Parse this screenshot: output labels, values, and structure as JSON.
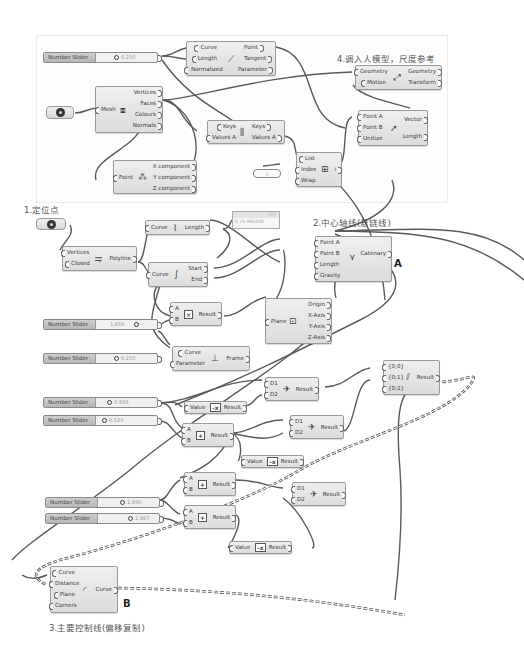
{
  "canvas": {
    "background": "#ffffff",
    "wire_color": "#5a5a5a",
    "node_fill": "#e6e6e6"
  },
  "annotations": {
    "step1": "1.定位点",
    "step2": "2.中心轴线(悬链线)",
    "step3": "3.主要控制线(偏移复制)",
    "step4": "4.调入人模型，尺度参考",
    "label_a": "A",
    "label_b": "B"
  },
  "sliders": [
    {
      "id": "s1",
      "label": "Number Slider",
      "value": "0.250"
    },
    {
      "id": "s2",
      "label": "Number Slider",
      "value": "1.666"
    },
    {
      "id": "s3",
      "label": "Number Slider",
      "value": "0.250"
    },
    {
      "id": "s4",
      "label": "Number Slider",
      "value": "0.939"
    },
    {
      "id": "s5",
      "label": "Number Slider",
      "value": "0.520"
    },
    {
      "id": "s6",
      "label": "Number Slider",
      "value": "1.890"
    },
    {
      "id": "s7",
      "label": "Number Slider",
      "value": "2.987"
    }
  ],
  "nodes": {
    "eval_length": {
      "inputs": [
        "Curve",
        "Length",
        "Normalized"
      ],
      "outputs": [
        "Point",
        "Tangent",
        "Parameter"
      ],
      "icon": "eval-length-icon"
    },
    "mesh_decon": {
      "inputs": [
        "Mesh"
      ],
      "outputs": [
        "Vertices",
        "Faces",
        "Colours",
        "Normals"
      ],
      "icon": "mesh-icon"
    },
    "decon_point": {
      "inputs": [
        "Point"
      ],
      "outputs": [
        "X component",
        "Y component",
        "Z component"
      ],
      "icon": "deconstruct-point-icon"
    },
    "sort_list": {
      "inputs": [
        "Keys",
        "Values A"
      ],
      "outputs": [
        "Keys",
        "Values A"
      ],
      "icon": "sort-icon"
    },
    "list_item": {
      "inputs": [
        "List",
        "Index",
        "Wrap"
      ],
      "outputs": [
        "i"
      ],
      "icon": "list-item-icon"
    },
    "vector_2pt": {
      "inputs": [
        "Point A",
        "Point B",
        "Unitize"
      ],
      "outputs": [
        "Vector",
        "Length"
      ],
      "icon": "vector-icon"
    },
    "move": {
      "inputs": [
        "Geometry",
        "Motion"
      ],
      "outputs": [
        "Geometry",
        "Transform"
      ],
      "icon": "move-icon"
    },
    "polyline": {
      "inputs": [
        "Vertices",
        "Closed"
      ],
      "outputs": [
        "Polyline"
      ],
      "icon": "polyline-icon"
    },
    "length": {
      "inputs": [
        "Curve"
      ],
      "outputs": [
        "Length"
      ],
      "icon": "length-icon"
    },
    "end_points": {
      "inputs": [
        "Curve"
      ],
      "outputs": [
        "Start",
        "End"
      ],
      "icon": "endpoints-icon"
    },
    "catenary": {
      "inputs": [
        "Point A",
        "Point B",
        "Length",
        "Gravity"
      ],
      "outputs": [
        "Catenary"
      ],
      "icon": "catenary-icon"
    },
    "multiply": {
      "inputs": [
        "A",
        "B"
      ],
      "outputs": [
        "Result"
      ],
      "icon_text": "×"
    },
    "deplane": {
      "inputs": [
        "Plane"
      ],
      "outputs": [
        "Origin",
        "X-Axis",
        "Y-Axis",
        "Z-Axis"
      ],
      "icon": "plane-icon"
    },
    "perp_frame": {
      "inputs": [
        "Curve",
        "Parameter"
      ],
      "outputs": [
        "Frame"
      ],
      "icon": "frame-icon"
    },
    "merge1": {
      "inputs": [
        "D1",
        "D2"
      ],
      "outputs": [
        "Result"
      ],
      "icon": "merge-icon"
    },
    "negative1": {
      "inputs": [
        "Value"
      ],
      "outputs": [
        "Result"
      ],
      "icon_text": "-x"
    },
    "add1": {
      "inputs": [
        "A",
        "B"
      ],
      "outputs": [
        "Result"
      ],
      "icon_text": "+"
    },
    "merge2": {
      "inputs": [
        "D1",
        "D2"
      ],
      "outputs": [
        "Result"
      ],
      "icon": "merge-icon"
    },
    "negative2": {
      "inputs": [
        "Value"
      ],
      "outputs": [
        "Result"
      ],
      "icon_text": "-x"
    },
    "entwine": {
      "inputs": [
        "{0;0}",
        "{0;1}",
        "{0;2}"
      ],
      "outputs": [
        "Result"
      ],
      "icon": "entwine-icon"
    },
    "add2": {
      "inputs": [
        "A",
        "B"
      ],
      "outputs": [
        "Result"
      ],
      "icon_text": "+"
    },
    "add3": {
      "inputs": [
        "A",
        "B"
      ],
      "outputs": [
        "Result"
      ],
      "icon_text": "+"
    },
    "merge3": {
      "inputs": [
        "D1",
        "D2"
      ],
      "outputs": [
        "Result"
      ],
      "icon": "merge-icon"
    },
    "negative3": {
      "inputs": [
        "Value"
      ],
      "outputs": [
        "Result"
      ],
      "icon_text": "-x"
    },
    "offset": {
      "inputs": [
        "Curve",
        "Distance",
        "Plane",
        "Corners"
      ],
      "outputs": [
        "Curve"
      ],
      "icon": "offset-icon"
    }
  },
  "panel": {
    "header": "{0}",
    "value": "0 25.986308"
  },
  "index_value": "0"
}
